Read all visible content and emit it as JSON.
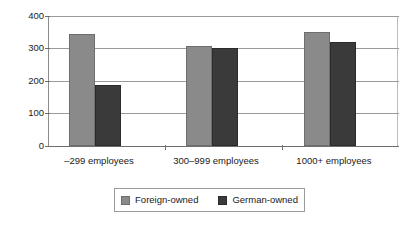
{
  "chart_data": {
    "type": "bar",
    "title": "",
    "xlabel": "",
    "ylabel": "",
    "categories": [
      "–299 employees",
      "300–999 employees",
      "1000+ employees"
    ],
    "series": [
      {
        "name": "Foreign-owned",
        "color": "#8a8a8a",
        "values": [
          345,
          308,
          352
        ]
      },
      {
        "name": "German-owned",
        "color": "#3a3a3a",
        "values": [
          188,
          302,
          320
        ]
      }
    ],
    "ylim": [
      0,
      400
    ],
    "yticks": [
      0,
      100,
      200,
      300,
      400
    ],
    "ytick_labels": [
      "0",
      "100",
      "200",
      "300",
      "400"
    ],
    "grid": true,
    "legend_position": "bottom-center"
  },
  "axis": {
    "y_labels": [
      "400",
      "300",
      "200",
      "100",
      "0"
    ]
  },
  "legend": {
    "items": [
      {
        "label": "Foreign-owned"
      },
      {
        "label": "German-owned"
      }
    ]
  },
  "colors": {
    "foreign": "#8a8a8a",
    "german": "#3a3a3a",
    "grid": "#9a9a9a",
    "axis": "#6f6f6f",
    "background": "#ffffff"
  }
}
